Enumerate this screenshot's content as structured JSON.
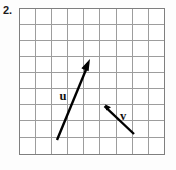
{
  "figure": {
    "problem_number": "2.",
    "grid": {
      "columns": 9,
      "rows": 9,
      "cell_size_px": 16,
      "origin_x_px": 19,
      "origin_y_px": 8,
      "line_color": "#9a9a9a",
      "border_color": "#8a8a8a",
      "background_color": "#ffffff"
    },
    "vectors": [
      {
        "name": "u",
        "label": "u",
        "label_x": 44,
        "label_y": 92,
        "tail_x": 38,
        "tail_y": 132,
        "tip_x": 71,
        "tip_y": 52,
        "components_cells": {
          "dx": 2,
          "dy": 5
        },
        "color": "#000000",
        "stroke_width": 2.4
      },
      {
        "name": "v",
        "label": "v",
        "label_x": 104,
        "label_y": 112,
        "tail_x": 115,
        "tail_y": 126,
        "tip_x": 81,
        "tip_y": 94,
        "components_cells": {
          "dx": -2,
          "dy": 2
        },
        "color": "#000000",
        "stroke_width": 2.4
      }
    ]
  }
}
